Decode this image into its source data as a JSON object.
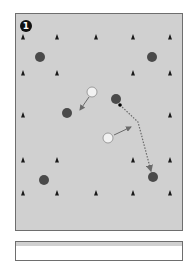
{
  "diagram": {
    "type": "drill-diagram",
    "badge": {
      "label": "1",
      "x": 26,
      "y": 26
    },
    "colors": {
      "field": "#d0d0d0",
      "border": "#6e6e6e",
      "dark_player": "#4a4a4a",
      "light_player": "#f2f2f2",
      "cone": "#1a1a1a",
      "arrow": "#6a6a6a"
    },
    "cones": [
      {
        "x": 23,
        "y": 37
      },
      {
        "x": 57,
        "y": 37
      },
      {
        "x": 96,
        "y": 37
      },
      {
        "x": 133,
        "y": 37
      },
      {
        "x": 170,
        "y": 37
      },
      {
        "x": 23,
        "y": 73
      },
      {
        "x": 57,
        "y": 73
      },
      {
        "x": 133,
        "y": 73
      },
      {
        "x": 170,
        "y": 73
      },
      {
        "x": 23,
        "y": 115
      },
      {
        "x": 170,
        "y": 115
      },
      {
        "x": 23,
        "y": 160
      },
      {
        "x": 57,
        "y": 160
      },
      {
        "x": 133,
        "y": 160
      },
      {
        "x": 170,
        "y": 160
      },
      {
        "x": 23,
        "y": 193
      },
      {
        "x": 57,
        "y": 193
      },
      {
        "x": 96,
        "y": 193
      },
      {
        "x": 133,
        "y": 193
      },
      {
        "x": 170,
        "y": 193
      }
    ],
    "dark_players": [
      {
        "x": 40,
        "y": 57
      },
      {
        "x": 152,
        "y": 57
      },
      {
        "x": 67,
        "y": 113
      },
      {
        "x": 116,
        "y": 99
      },
      {
        "x": 153,
        "y": 177
      },
      {
        "x": 44,
        "y": 180
      }
    ],
    "light_players": [
      {
        "x": 92,
        "y": 92
      },
      {
        "x": 108,
        "y": 138
      }
    ],
    "ball": {
      "x": 120,
      "y": 105
    },
    "movement_arrows": [
      {
        "from": [
          89,
          97
        ],
        "to": [
          80,
          110
        ]
      },
      {
        "from": [
          114,
          135
        ],
        "to": [
          131,
          127
        ]
      }
    ],
    "pass_path": [
      [
        120,
        105
      ],
      [
        138,
        122
      ],
      [
        151,
        171
      ]
    ]
  }
}
